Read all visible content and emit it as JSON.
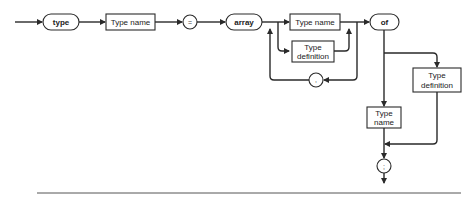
{
  "diagram": {
    "type": "syntax-diagram",
    "keywords": {
      "type": "type",
      "array": "array",
      "of": "of"
    },
    "symbols": {
      "equals": "=",
      "comma": ",",
      "semicolon": ";"
    },
    "boxes": {
      "type_name_1": "Type name",
      "index_type_name": "Type name",
      "index_type_def_1": "Type",
      "index_type_def_2": "definition",
      "elem_type_def_1": "Type",
      "elem_type_def_2": "definition",
      "elem_type_name_1": "Type",
      "elem_type_name_2": "name"
    },
    "colors": {
      "line": "#2a2a2a",
      "background": "#ffffff"
    }
  }
}
